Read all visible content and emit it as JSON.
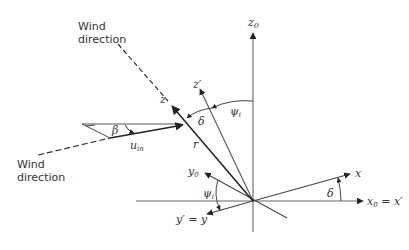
{
  "diagram": {
    "type": "coordinate-frame-geometry",
    "labels": {
      "wind_top": [
        "Wind",
        "direction"
      ],
      "wind_left": [
        "Wind",
        "direction"
      ],
      "z0": "z",
      "z0_sub": "0",
      "z_prime": "z′",
      "z": "z",
      "psi_top": "ψ",
      "psi_top_sub": "i",
      "delta_top": "δ",
      "r": "r",
      "beta": "β",
      "u_in": "u",
      "u_in_sub": "in",
      "y0": "y",
      "y0_sub": "0",
      "psi_bottom": "ψ",
      "psi_bottom_sub": "i",
      "y_prime_eq_y": "y′ = y",
      "x": "x",
      "delta_right": "δ",
      "x0": "x",
      "x0_sub": "0",
      "x0_eq": " = x′"
    },
    "colors": {
      "line": "#555555",
      "dark_line": "#222222",
      "text": "#333333"
    }
  }
}
